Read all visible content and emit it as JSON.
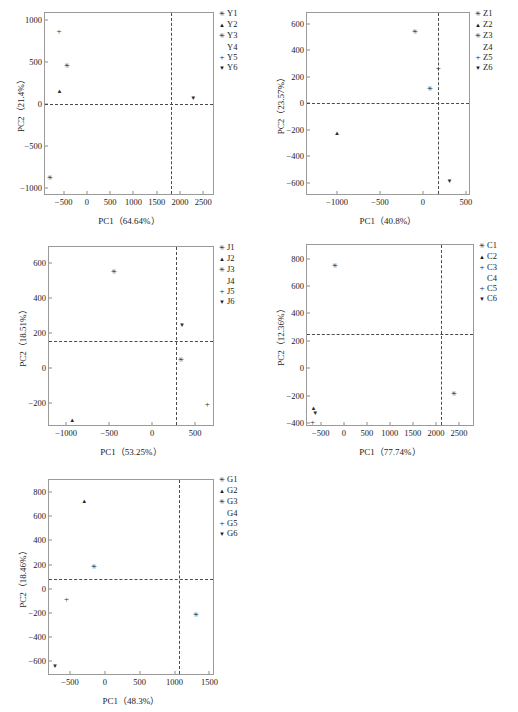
{
  "figure": {
    "panel_count": 5,
    "marker_glyphs": {
      "asterisk": "✳",
      "triangle-up": "▲",
      "triangle-down": "▼",
      "plus": "+",
      "none": ""
    }
  },
  "chart_data": [
    {
      "type": "scatter",
      "id": "panel-y",
      "title": "",
      "xlabel": "PC1（64.64%）",
      "ylabel": "PC2（21.4%）",
      "xlim": [
        -900,
        2750
      ],
      "ylim": [
        -1100,
        1080
      ],
      "xticks": [
        -500,
        0,
        500,
        1000,
        1500,
        2000,
        2500
      ],
      "yticks": [
        -1000,
        -500,
        0,
        500,
        1000
      ],
      "grid": false,
      "ref_hline": 0,
      "ref_vline": 1810,
      "legend_position": "right",
      "legend": [
        "Y1",
        "Y2",
        "Y3",
        "Y4",
        "Y5",
        "Y6"
      ],
      "legend_markers": [
        "asterisk",
        "triangle-up",
        "asterisk",
        "none",
        "plus",
        "triangle-down"
      ],
      "points": [
        {
          "label": "Y5",
          "marker": "plus",
          "x": -600,
          "y": 860
        },
        {
          "label": "Y3",
          "marker": "asterisk",
          "x": -430,
          "y": 450
        },
        {
          "label": "Y2",
          "marker": "triangle-up",
          "x": -590,
          "y": 155
        },
        {
          "label": "Y6",
          "marker": "triangle-down",
          "x": 2280,
          "y": 70
        },
        {
          "label": "Y1",
          "marker": "asterisk",
          "x": -790,
          "y": -890
        }
      ]
    },
    {
      "type": "scatter",
      "id": "panel-z",
      "title": "",
      "xlabel": "PC1（40.8%）",
      "ylabel": "PC2（23.57%）",
      "xlim": [
        -1350,
        560
      ],
      "ylim": [
        -700,
        680
      ],
      "xticks": [
        -1000,
        -500,
        0,
        500
      ],
      "yticks": [
        -600,
        -400,
        -200,
        0,
        200,
        400,
        600
      ],
      "grid": false,
      "ref_hline": 0,
      "ref_vline": 175,
      "legend_position": "right",
      "legend": [
        "Z1",
        "Z2",
        "Z3",
        "Z4",
        "Z5",
        "Z6"
      ],
      "legend_markers": [
        "asterisk",
        "triangle-up",
        "asterisk",
        "none",
        "plus",
        "triangle-down"
      ],
      "points": [
        {
          "label": "Z1",
          "marker": "asterisk",
          "x": -90,
          "y": 540
        },
        {
          "label": "Z5",
          "marker": "plus",
          "x": 180,
          "y": 265
        },
        {
          "label": "Z3",
          "marker": "asterisk",
          "x": 85,
          "y": 105
        },
        {
          "label": "Z2",
          "marker": "triangle-up",
          "x": -1000,
          "y": -222
        },
        {
          "label": "Z6",
          "marker": "triangle-down",
          "x": 310,
          "y": -588
        }
      ]
    },
    {
      "type": "scatter",
      "id": "panel-j",
      "title": "",
      "xlabel": "PC1（53.25%）",
      "ylabel": "PC2（18.51%）",
      "xlim": [
        -1200,
        730
      ],
      "ylim": [
        -340,
        690
      ],
      "xticks": [
        -1000,
        -500,
        0,
        500
      ],
      "yticks": [
        -200,
        0,
        200,
        400,
        600
      ],
      "grid": false,
      "ref_hline": 150,
      "ref_vline": 280,
      "legend_position": "right",
      "legend": [
        "J1",
        "J2",
        "J3",
        "J4",
        "J5",
        "J6"
      ],
      "legend_markers": [
        "asterisk",
        "triangle-up",
        "asterisk",
        "none",
        "plus",
        "triangle-down"
      ],
      "points": [
        {
          "label": "J1",
          "marker": "asterisk",
          "x": -440,
          "y": 545
        },
        {
          "label": "J6",
          "marker": "triangle-down",
          "x": 345,
          "y": 245
        },
        {
          "label": "J3",
          "marker": "asterisk",
          "x": 340,
          "y": 42
        },
        {
          "label": "J5",
          "marker": "plus",
          "x": 640,
          "y": -207
        },
        {
          "label": "J2",
          "marker": "triangle-up",
          "x": -930,
          "y": -302
        }
      ]
    },
    {
      "type": "scatter",
      "id": "panel-c",
      "title": "",
      "xlabel": "PC1（77.74%）",
      "ylabel": "PC2（12.36%）",
      "xlim": [
        -800,
        2850
      ],
      "ylim": [
        -430,
        900
      ],
      "xticks": [
        -500,
        0,
        500,
        1000,
        1500,
        2000,
        2500
      ],
      "yticks": [
        -400,
        -200,
        0,
        200,
        400,
        600,
        800
      ],
      "grid": false,
      "ref_hline": 248,
      "ref_vline": 2110,
      "legend_position": "right",
      "legend": [
        "C1",
        "C2",
        "C3",
        "C4",
        "C5",
        "C6"
      ],
      "legend_markers": [
        "asterisk",
        "triangle-up",
        "plus",
        "none",
        "plus",
        "triangle-down"
      ],
      "points": [
        {
          "label": "C1",
          "marker": "asterisk",
          "x": -195,
          "y": 750
        },
        {
          "label": "C3",
          "marker": "asterisk",
          "x": 2400,
          "y": -188
        },
        {
          "label": "C2",
          "marker": "triangle-up",
          "x": -660,
          "y": -292
        },
        {
          "label": "C6",
          "marker": "triangle-down",
          "x": -620,
          "y": -330
        },
        {
          "label": "C5",
          "marker": "plus",
          "x": -680,
          "y": -392
        }
      ]
    },
    {
      "type": "scatter",
      "id": "panel-g",
      "title": "",
      "xlabel": "PC1（48.3%）",
      "ylabel": "PC2（18.46%）",
      "xlim": [
        -800,
        1580
      ],
      "ylim": [
        -720,
        900
      ],
      "xticks": [
        -500,
        0,
        500,
        1000,
        1500
      ],
      "yticks": [
        -600,
        -400,
        -200,
        0,
        200,
        400,
        600,
        800
      ],
      "grid": false,
      "ref_hline": 80,
      "ref_vline": 1070,
      "legend_position": "right",
      "legend": [
        "G1",
        "G2",
        "G3",
        "G4",
        "G5",
        "G6"
      ],
      "legend_markers": [
        "asterisk",
        "triangle-up",
        "asterisk",
        "none",
        "plus",
        "triangle-down"
      ],
      "points": [
        {
          "label": "G2",
          "marker": "triangle-up",
          "x": -295,
          "y": 730
        },
        {
          "label": "G3",
          "marker": "asterisk",
          "x": -160,
          "y": 185
        },
        {
          "label": "G5",
          "marker": "plus",
          "x": -550,
          "y": -85
        },
        {
          "label": "G1",
          "marker": "asterisk",
          "x": 1305,
          "y": -218
        },
        {
          "label": "G6",
          "marker": "triangle-down",
          "x": -715,
          "y": -640
        }
      ]
    }
  ]
}
